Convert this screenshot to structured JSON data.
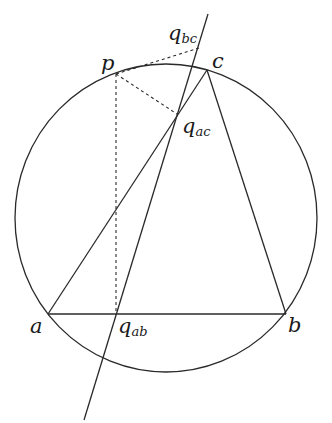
{
  "diagram": {
    "colors": {
      "stroke": "#2a2a2a",
      "background": "#ffffff"
    },
    "circle": {
      "cx": 166,
      "cy": 218,
      "rx": 151,
      "ry": 154
    },
    "points": {
      "a": {
        "x": 48,
        "y": 314
      },
      "b": {
        "x": 286,
        "y": 314
      },
      "c": {
        "x": 207,
        "y": 70
      },
      "p": {
        "x": 116,
        "y": 74
      },
      "q_ab": {
        "x": 116,
        "y": 314
      },
      "q_ac": {
        "x": 177,
        "y": 114
      },
      "q_bc": {
        "x": 199,
        "y": 48
      }
    },
    "simson_line": {
      "x1": 208,
      "y1": 14,
      "x2": 84,
      "y2": 420
    },
    "labels": {
      "a": {
        "main": "a",
        "x": 30,
        "y": 333
      },
      "b": {
        "main": "b",
        "x": 288,
        "y": 332
      },
      "c": {
        "main": "c",
        "x": 212,
        "y": 68
      },
      "p": {
        "main": "p",
        "x": 101,
        "y": 70
      },
      "q_ab": {
        "main": "q",
        "sub": "ab",
        "x": 118,
        "y": 333
      },
      "q_ac": {
        "main": "q",
        "sub": "ac",
        "x": 182,
        "y": 133
      },
      "q_bc": {
        "main": "q",
        "sub": "bc",
        "x": 168,
        "y": 40
      }
    }
  }
}
